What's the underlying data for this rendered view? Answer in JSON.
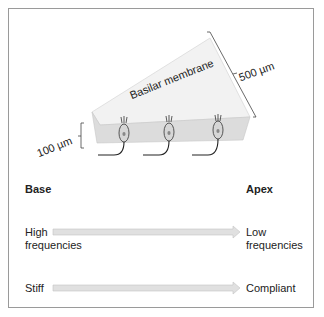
{
  "diagram": {
    "membrane_label": "Basilar membrane",
    "width_base": "100 µm",
    "width_apex": "500 µm",
    "hair_cell_count": 3
  },
  "axis": {
    "left_title": "Base",
    "right_title": "Apex",
    "rows": [
      {
        "left": [
          "High",
          "frequencies"
        ],
        "right": [
          "Low",
          "frequencies"
        ]
      },
      {
        "left": [
          "Stiff"
        ],
        "right": [
          "Compliant"
        ]
      }
    ]
  },
  "colors": {
    "membrane_top": "#f1f1f1",
    "membrane_front": "#dcdcdc",
    "cell_fill": "#d6d6d6",
    "arrow_fill": "#dedede",
    "text": "#222222"
  }
}
